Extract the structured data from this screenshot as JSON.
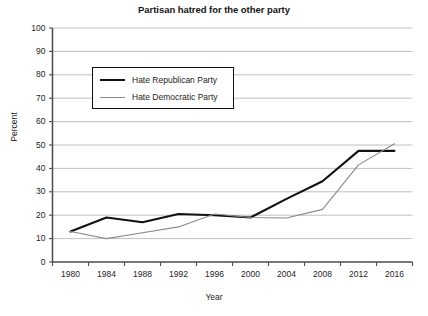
{
  "chart_data": {
    "type": "line",
    "title": "Partisan hatred for the other party",
    "xlabel": "Year",
    "ylabel": "Percent",
    "x": [
      1980,
      1984,
      1988,
      1992,
      1996,
      2000,
      2004,
      2008,
      2012,
      2016
    ],
    "categories": [
      "1980",
      "1984",
      "1988",
      "1992",
      "1996",
      "2000",
      "2004",
      "2008",
      "2012",
      "2016"
    ],
    "xlim": [
      1978,
      2018
    ],
    "ylim": [
      0,
      100
    ],
    "ytick_labels": [
      "0",
      "10",
      "20",
      "30",
      "40",
      "50",
      "60",
      "70",
      "80",
      "90",
      "100"
    ],
    "ytick_values": [
      0,
      10,
      20,
      30,
      40,
      50,
      60,
      70,
      80,
      90,
      100
    ],
    "grid": "horizontal",
    "legend_position": "upper-left-inside",
    "series": [
      {
        "name": "Hate Republican Party",
        "color": "#111111",
        "width": 2.1,
        "values": [
          13,
          19,
          17,
          20.5,
          20,
          19,
          27,
          34.5,
          47.5,
          47.5
        ]
      },
      {
        "name": "Hate Democratic Party",
        "color": "#8a8a8a",
        "width": 1.1,
        "values": [
          13,
          10,
          12.5,
          15,
          20.5,
          19,
          18.8,
          22.5,
          41.5,
          50.5
        ]
      }
    ]
  },
  "axes": {
    "title": "Partisan hatred for the other party",
    "x_axis_label": "Year",
    "y_axis_label": "Percent"
  }
}
